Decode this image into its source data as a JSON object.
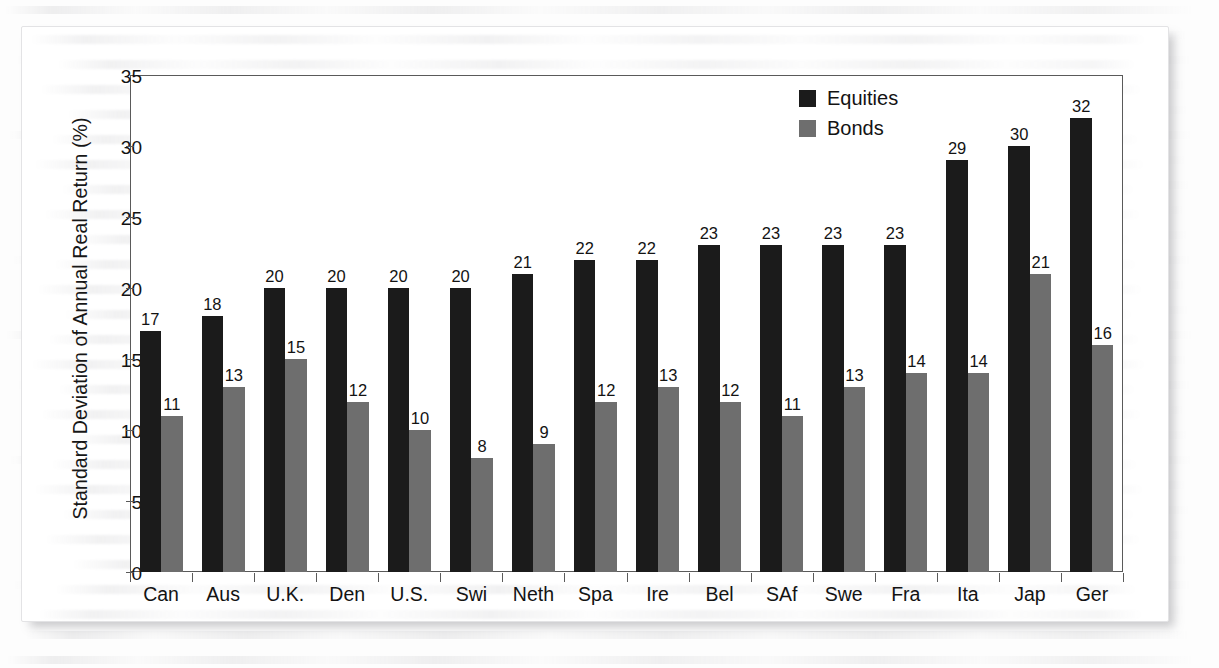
{
  "chart_data": {
    "type": "bar",
    "title": "",
    "xlabel": "",
    "ylabel": "Standard Deviation of Annual Real Return (%)",
    "ylim": [
      0,
      35
    ],
    "yticks": [
      0,
      5,
      10,
      15,
      20,
      25,
      30,
      35
    ],
    "grid": false,
    "legend_position": "top-right",
    "categories": [
      "Can",
      "Aus",
      "U.K.",
      "Den",
      "U.S.",
      "Swi",
      "Neth",
      "Spa",
      "Ire",
      "Bel",
      "SAf",
      "Swe",
      "Fra",
      "Ita",
      "Jap",
      "Ger"
    ],
    "series": [
      {
        "name": "Equities",
        "color": "#1b1b1b",
        "values": [
          17,
          18,
          20,
          20,
          20,
          20,
          21,
          22,
          22,
          23,
          23,
          23,
          23,
          29,
          30,
          32
        ]
      },
      {
        "name": "Bonds",
        "color": "#6e6e6e",
        "values": [
          11,
          13,
          15,
          12,
          10,
          8,
          9,
          12,
          13,
          12,
          11,
          13,
          14,
          14,
          21,
          16
        ]
      }
    ]
  },
  "axis": {
    "y_title": "Standard Deviation of Annual Real Return (%)",
    "y_tick_labels": [
      "0",
      "5",
      "10",
      "15",
      "20",
      "25",
      "30",
      "35"
    ]
  },
  "legend": {
    "items": [
      {
        "label": "Equities",
        "color": "#1b1b1b"
      },
      {
        "label": "Bonds",
        "color": "#6e6e6e"
      }
    ]
  },
  "colors": {
    "equities": "#1b1b1b",
    "bonds": "#6e6e6e",
    "axis": "#5a5a5a",
    "text": "#131313",
    "card_background": "#ffffff",
    "page_background": "#fdfdfd"
  }
}
